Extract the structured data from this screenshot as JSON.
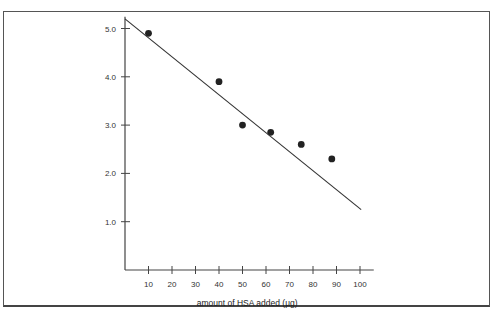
{
  "chart_data": {
    "type": "scatter",
    "title": "",
    "xlabel": "amount of HSA added (µg)",
    "ylabel": "",
    "x_ticks": [
      "10",
      "20",
      "30",
      "40",
      "50",
      "60",
      "70",
      "80",
      "90",
      "100"
    ],
    "y_ticks": [
      "1.0",
      "2.0",
      "3.0",
      "4.0",
      "5.0"
    ],
    "xlim": [
      0,
      105
    ],
    "ylim": [
      0,
      5.2
    ],
    "grid": false,
    "legend": null,
    "series": [
      {
        "name": "measurements",
        "type": "scatter",
        "x": [
          10,
          40,
          50,
          62,
          75,
          88
        ],
        "y": [
          4.9,
          3.9,
          3.0,
          2.85,
          2.6,
          2.3
        ]
      },
      {
        "name": "fit line",
        "type": "line",
        "x": [
          0,
          100.5
        ],
        "y": [
          5.2,
          1.25
        ]
      }
    ]
  },
  "colors": {
    "ink": "#222222",
    "frame": "#555555",
    "background": "#ffffff"
  }
}
